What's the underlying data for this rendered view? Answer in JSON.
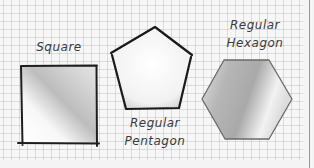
{
  "diagram": {
    "shapes": [
      {
        "id": "square",
        "label": "Square"
      },
      {
        "id": "pentagon",
        "label_line1": "Regular",
        "label_line2": "Pentagon"
      },
      {
        "id": "hexagon",
        "label_line1": "Regular",
        "label_line2": "Hexagon"
      }
    ],
    "colors": {
      "paper": "#f7f7f7",
      "grid": "#c4c4c4",
      "outline": "#1e1e1e",
      "hexagon_outline": "#6a6a6a",
      "text": "#3a3a3a"
    }
  }
}
